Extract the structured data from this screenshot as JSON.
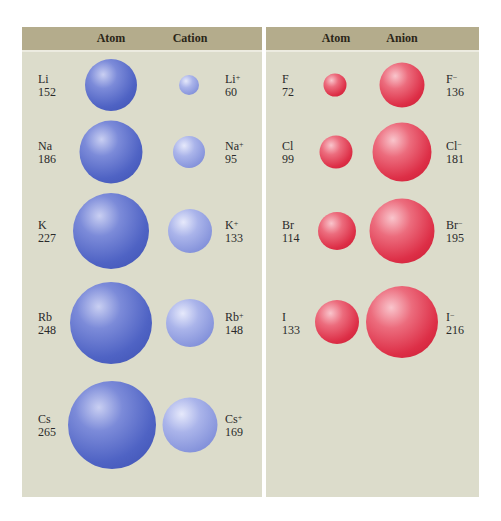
{
  "left_panel": {
    "headers": {
      "atom": "Atom",
      "ion": "Cation"
    },
    "rows": [
      {
        "atom_symbol": "Li",
        "atom_radius": "152",
        "ion_symbol": "Li",
        "ion_charge": "+",
        "ion_radius": "60"
      },
      {
        "atom_symbol": "Na",
        "atom_radius": "186",
        "ion_symbol": "Na",
        "ion_charge": "+",
        "ion_radius": "95"
      },
      {
        "atom_symbol": "K",
        "atom_radius": "227",
        "ion_symbol": "K",
        "ion_charge": "+",
        "ion_radius": "133"
      },
      {
        "atom_symbol": "Rb",
        "atom_radius": "248",
        "ion_symbol": "Rb",
        "ion_charge": "+",
        "ion_radius": "148"
      },
      {
        "atom_symbol": "Cs",
        "atom_radius": "265",
        "ion_symbol": "Cs",
        "ion_charge": "+",
        "ion_radius": "169"
      }
    ]
  },
  "right_panel": {
    "headers": {
      "atom": "Atom",
      "ion": "Anion"
    },
    "rows": [
      {
        "atom_symbol": "F",
        "atom_radius": "72",
        "ion_symbol": "F",
        "ion_charge": "−",
        "ion_radius": "136"
      },
      {
        "atom_symbol": "Cl",
        "atom_radius": "99",
        "ion_symbol": "Cl",
        "ion_charge": "−",
        "ion_radius": "181"
      },
      {
        "atom_symbol": "Br",
        "atom_radius": "114",
        "ion_symbol": "Br",
        "ion_charge": "−",
        "ion_radius": "195"
      },
      {
        "atom_symbol": "I",
        "atom_radius": "133",
        "ion_symbol": "I",
        "ion_charge": "−",
        "ion_radius": "216"
      }
    ]
  },
  "colors": {
    "header_bg": "#b4ac8c",
    "panel_bg": "#dcdccb",
    "atom_blue": "#4f63c4",
    "cation_blue": "#8593db",
    "red": "#dd2f47"
  }
}
